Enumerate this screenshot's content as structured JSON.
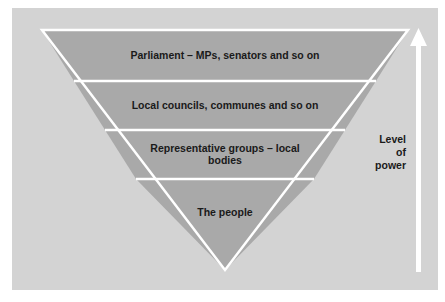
{
  "diagram": {
    "type": "inverted-pyramid",
    "levels": [
      {
        "label": "Parliament – MPs, senators and so on"
      },
      {
        "label": "Local councils, communes and so on"
      },
      {
        "label": "Representative groups – local bodies"
      },
      {
        "label": "The people"
      }
    ],
    "axis": {
      "label_line1": "Level",
      "label_line2": "of",
      "label_line3": "power",
      "direction": "up"
    },
    "colors": {
      "background": "#d3d3d3",
      "band": "#a9a9a9",
      "divider": "#ffffff",
      "arrow": "#ffffff",
      "text": "#1a1a1a"
    }
  }
}
